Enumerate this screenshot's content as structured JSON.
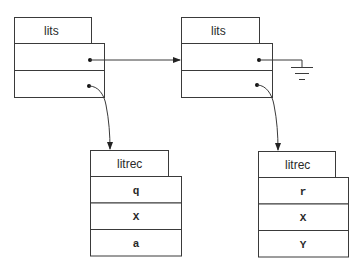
{
  "diagram": {
    "nodes": [
      {
        "id": "lits-left",
        "title": "lits",
        "fields": [
          "",
          ""
        ]
      },
      {
        "id": "lits-right",
        "title": "lits",
        "fields": [
          "",
          ""
        ]
      },
      {
        "id": "litrec-left",
        "title": "litrec",
        "fields": [
          "q",
          "X",
          "a"
        ]
      },
      {
        "id": "litrec-right",
        "title": "litrec",
        "fields": [
          "r",
          "X",
          "Y"
        ]
      }
    ],
    "edges": [
      {
        "from": "lits-left.field0",
        "to": "lits-right",
        "style": "arrow"
      },
      {
        "from": "lits-right.field0",
        "to": "ground",
        "style": "null-ground"
      },
      {
        "from": "lits-left.field1",
        "to": "litrec-left",
        "style": "curved-arrow"
      },
      {
        "from": "lits-right.field1",
        "to": "litrec-right",
        "style": "curved-arrow"
      }
    ]
  }
}
